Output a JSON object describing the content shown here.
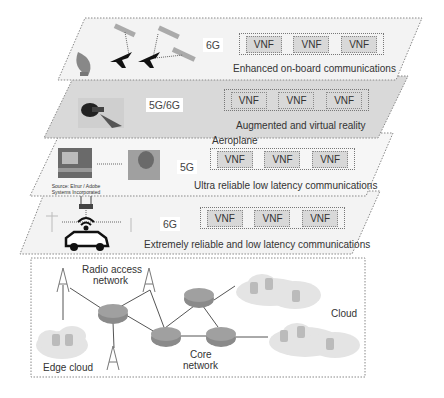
{
  "diagram": {
    "layers": [
      {
        "id": "layer-1",
        "generation": "6G",
        "use_case": "Enhanced on-board communications",
        "functions": [
          "VNF",
          "VNF",
          "VNF"
        ],
        "fill": "#f3f3f3"
      },
      {
        "id": "layer-2",
        "generation": "5G/6G",
        "use_case": "Augmented and virtual reality",
        "functions": [
          "VNF",
          "VNF",
          "VNF"
        ],
        "fill": "#d9d9d9"
      },
      {
        "id": "layer-3",
        "generation": "5G",
        "use_case": "Ultra reliable low latency communications",
        "functions": [
          "VNF",
          "VNF",
          "VNF"
        ],
        "fill": "#f6f6f6",
        "extra_label": "Aeroplane",
        "image_credit": "Source: Elnur / Adobe Systems Incorporated"
      },
      {
        "id": "layer-4",
        "generation": "6G",
        "use_case": "Extremely reliable and low latency communications",
        "functions": [
          "VNF",
          "VNF",
          "VNF"
        ],
        "fill": "#f3f3f3"
      }
    ],
    "network": {
      "radio_access_label": "Radio access network",
      "radio_access_line1": "Radio access",
      "radio_access_line2": "network",
      "core_line1": "Core",
      "core_line2": "network",
      "edge_cloud_label": "Edge cloud",
      "cloud_label": "Cloud"
    },
    "colors": {
      "router": "#8a8a8a",
      "cloud": "#e4e4e4",
      "border": "#888888"
    }
  }
}
